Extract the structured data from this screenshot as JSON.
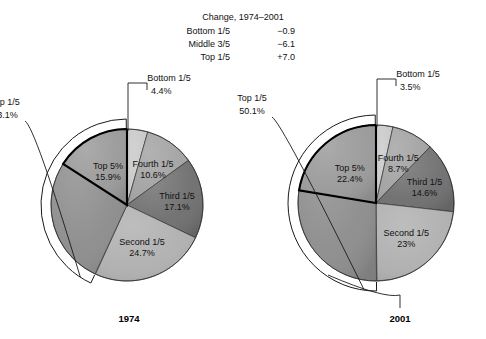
{
  "header": {
    "title": "Change, 1974–2001",
    "rows": [
      {
        "label": "Bottom 1/5",
        "value": "−0.9"
      },
      {
        "label": "Middle 3/5",
        "value": "−6.1"
      },
      {
        "label": "Top 1/5",
        "value": "+7.0"
      }
    ]
  },
  "charts": [
    {
      "year": "1974",
      "cx": 127,
      "cy": 205,
      "r": 76,
      "bracket_label_line1": "Top 1/5",
      "bracket_label_line2": "43.1%",
      "callout_label_line1": "Bottom 1/5",
      "callout_label_line2": "4.4%",
      "slices": [
        {
          "name": "Bottom 1/5",
          "pct_label": "4.4%",
          "value": 4.4,
          "color": "#c9c9c9",
          "color2": "#bdbdbd"
        },
        {
          "name": "Fourth 1/5",
          "pct_label": "10.6%",
          "value": 10.6,
          "color": "#a3a3a3",
          "color2": "#929292"
        },
        {
          "name": "Third 1/5",
          "pct_label": "17.1%",
          "value": 17.1,
          "color": "#6f6f6f",
          "color2": "#616161"
        },
        {
          "name": "Second 1/5",
          "pct_label": "24.7%",
          "value": 24.7,
          "color": "#b0b0b0",
          "color2": "#9e9e9e"
        },
        {
          "name": "Top 1/5",
          "pct_label": "43.1%",
          "value": 43.1,
          "color": "#8d8d8d",
          "color2": "#7e7e7e"
        }
      ],
      "top5": {
        "name": "Top 5%",
        "pct_label": "15.9%",
        "value": 15.9
      }
    },
    {
      "year": "2001",
      "cx": 376,
      "cy": 203,
      "r": 78,
      "bracket_label_line1": "Top 1/5",
      "bracket_label_line2": "50.1%",
      "callout_label_line1": "Bottom 1/5",
      "callout_label_line2": "3.5%",
      "slices": [
        {
          "name": "Bottom 1/5",
          "pct_label": "3.5%",
          "value": 3.5,
          "color": "#c9c9c9",
          "color2": "#bdbdbd"
        },
        {
          "name": "Fourth 1/5",
          "pct_label": "8.7%",
          "value": 8.7,
          "color": "#a3a3a3",
          "color2": "#929292"
        },
        {
          "name": "Third 1/5",
          "pct_label": "14.6%",
          "value": 14.6,
          "color": "#6f6f6f",
          "color2": "#616161"
        },
        {
          "name": "Second 1/5",
          "pct_label": "23%",
          "value": 23.0,
          "color": "#b0b0b0",
          "color2": "#9e9e9e"
        },
        {
          "name": "Top 1/5",
          "pct_label": "50.1%",
          "value": 50.1,
          "color": "#8d8d8d",
          "color2": "#7e7e7e"
        }
      ],
      "top5": {
        "name": "Top 5%",
        "pct_label": "22.4%",
        "value": 22.4
      }
    }
  ],
  "chart_data": {
    "type": "pie",
    "title": "Change, 1974–2001",
    "categories": [
      "Bottom 1/5",
      "Fourth 1/5",
      "Third 1/5",
      "Second 1/5",
      "Top 1/5"
    ],
    "series": [
      {
        "name": "1974",
        "values": [
          4.4,
          10.6,
          17.1,
          24.7,
          43.1
        ],
        "sub_slice": {
          "name": "Top 5%",
          "value": 15.9,
          "within": "Top 1/5"
        }
      },
      {
        "name": "2001",
        "values": [
          3.5,
          8.7,
          14.6,
          23.0,
          50.1
        ],
        "sub_slice": {
          "name": "Top 5%",
          "value": 22.4,
          "within": "Top 1/5"
        }
      }
    ],
    "annotations": [
      {
        "label": "Bottom 1/5",
        "change": -0.9
      },
      {
        "label": "Middle 3/5",
        "change": -6.1
      },
      {
        "label": "Top 1/5",
        "change": 7.0
      }
    ],
    "units": "percent of aggregate income",
    "legend": "none",
    "grid": false
  }
}
